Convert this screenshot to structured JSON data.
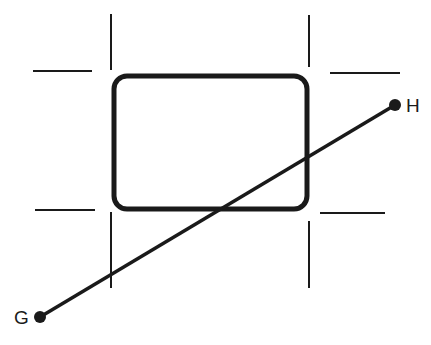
{
  "diagram": {
    "points": [
      {
        "id": "G",
        "label": "G"
      },
      {
        "id": "H",
        "label": "H"
      }
    ],
    "segment": {
      "from": "G",
      "to": "H"
    },
    "colors": {
      "stroke": "#1a1a1a",
      "background": "#ffffff"
    }
  }
}
